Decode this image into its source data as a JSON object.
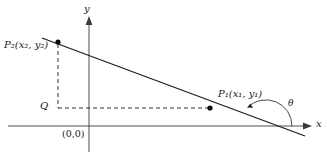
{
  "figure": {
    "background": "#ffffff",
    "stroke_color": "#1a1a1a",
    "width": 327,
    "height": 158
  },
  "axes": {
    "x_axis": {
      "label": "x",
      "icon": "arrow-right-icon",
      "y_pixel": 126,
      "x_start": 8,
      "x_end": 312
    },
    "y_axis": {
      "label": "y",
      "icon": "arrow-up-icon",
      "x_pixel": 89,
      "y_start": 18,
      "y_end": 152
    },
    "origin_label": "(0,0)"
  },
  "points": [
    {
      "name": "P2",
      "label_base": "P",
      "label_sub": "2",
      "coords_text": "(x₂, y₂)",
      "x": 58,
      "y": 42
    },
    {
      "name": "P1",
      "label_base": "P",
      "label_sub": "1",
      "coords_text": "(x₁, y₁)",
      "x": 210,
      "y": 108
    },
    {
      "name": "Q",
      "label_base": "Q",
      "label_sub": "",
      "coords_text": "",
      "x": 58,
      "y": 108
    }
  ],
  "labels": {
    "p2": "P₂(x₂, y₂)",
    "p1": "P₁(x₁, y₁)",
    "q": "Q",
    "origin": "(0,0)",
    "x_axis": "x",
    "y_axis": "y",
    "theta": "θ"
  },
  "line": {
    "name": "secant-line",
    "from_x": 42,
    "from_y": 38,
    "to_x": 305,
    "to_y": 136,
    "slope_description": "negative slope"
  },
  "dashed": {
    "vertical": {
      "x": 58,
      "y_top": 42,
      "y_bottom": 108
    },
    "horizontal": {
      "y": 108,
      "x_left": 58,
      "x_right": 210
    }
  },
  "angle": {
    "symbol": "θ",
    "vertex_x": 266,
    "vertex_y": 126,
    "arc_radius": 26,
    "description": "inclination angle between line and positive x-axis"
  }
}
